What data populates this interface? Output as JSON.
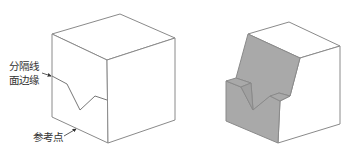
{
  "figure": {
    "left_cube": {
      "labels": {
        "split_line": "分隔线",
        "face_edge": "面边缘",
        "reference_point": "参考点"
      }
    },
    "right_cube": {
      "description": "split face shaded"
    }
  },
  "colors": {
    "line": "#8a8a8a",
    "shaded_face": "#a9a9a9",
    "text": "#333333",
    "background": "#ffffff"
  }
}
